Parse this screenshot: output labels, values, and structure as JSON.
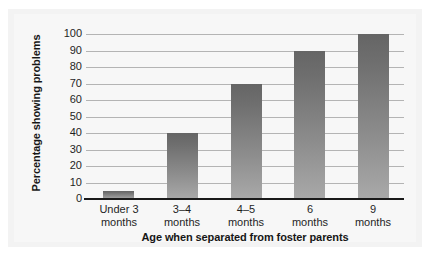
{
  "chart_data": {
    "type": "bar",
    "title": "",
    "xlabel": "Age when separated from foster parents",
    "ylabel": "Percentage showing problems",
    "categories": [
      "Under 3 months",
      "3–4 months",
      "4–5 months",
      "6 months",
      "9 months"
    ],
    "category_lines": [
      {
        "line1": "Under 3",
        "line2": "months"
      },
      {
        "line1": "3–4",
        "line2": "months"
      },
      {
        "line1": "4–5",
        "line2": "months"
      },
      {
        "line1": "6",
        "line2": "months"
      },
      {
        "line1": "9",
        "line2": "months"
      }
    ],
    "values": [
      5,
      40,
      70,
      90,
      100
    ],
    "ylim": [
      0,
      100
    ],
    "ytick_labels": [
      "100",
      "90",
      "80",
      "70",
      "60",
      "50",
      "40",
      "30",
      "20",
      "10",
      "0"
    ],
    "ytick_values": [
      100,
      90,
      80,
      70,
      60,
      50,
      40,
      30,
      20,
      10,
      0
    ],
    "grid": true,
    "legend": "none",
    "bar_color_top": "#656565",
    "bar_color_bottom": "#a9a9a9",
    "gridline_color": "#b4b4b4",
    "axis_color": "#1a1a1a",
    "background_color": "#f7f7f7"
  }
}
